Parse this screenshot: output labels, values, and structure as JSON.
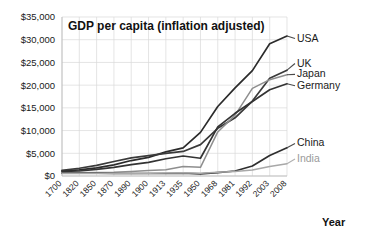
{
  "chart_data": {
    "type": "line",
    "title": "GDP per capita (inflation adjusted)",
    "xlabel": "Year",
    "ylabel": "",
    "ylim": [
      0,
      35000
    ],
    "grid": true,
    "legend_position": "inline-right",
    "categories": [
      "1700",
      "1820",
      "1850",
      "1870",
      "1890",
      "1900",
      "1913",
      "1935",
      "1950",
      "1968",
      "1981",
      "1992",
      "2003",
      "2008"
    ],
    "ytick_labels": [
      "$0",
      "$5,000",
      "$10,000",
      "$15,000",
      "$20,000",
      "$25,000",
      "$30,000",
      "$35,000"
    ],
    "ytick_values": [
      0,
      5000,
      10000,
      15000,
      20000,
      25000,
      30000,
      35000
    ],
    "series": [
      {
        "name": "USA",
        "color": "#2b2b2b",
        "values": [
          1100,
          1350,
          1800,
          2450,
          3400,
          4100,
          5300,
          6200,
          9600,
          15300,
          19400,
          23200,
          29100,
          30800
        ]
      },
      {
        "name": "UK",
        "color": "#3a3a3a",
        "values": [
          1250,
          1700,
          2350,
          3200,
          4000,
          4500,
          5000,
          5400,
          6900,
          10500,
          12800,
          16500,
          21500,
          23300
        ]
      },
      {
        "name": "Japan",
        "color": "#8e8e8e",
        "values": [
          800,
          700,
          750,
          800,
          1000,
          1200,
          1400,
          2100,
          1900,
          9700,
          13400,
          19300,
          21200,
          22300
        ]
      },
      {
        "name": "Germany",
        "color": "#333333",
        "values": [
          1000,
          1100,
          1450,
          1900,
          2500,
          3000,
          3800,
          4400,
          3900,
          10800,
          13800,
          16400,
          19000,
          20300
        ]
      },
      {
        "name": "China",
        "color": "#2e2e2e",
        "values": [
          600,
          600,
          600,
          550,
          550,
          550,
          550,
          600,
          450,
          750,
          1100,
          2200,
          4500,
          6200
        ]
      },
      {
        "name": "India",
        "color": "#a8a8a8",
        "values": [
          550,
          530,
          530,
          530,
          550,
          600,
          670,
          700,
          620,
          800,
          1000,
          1300,
          2100,
          2700
        ]
      }
    ],
    "series_labels": [
      {
        "name": "USA",
        "anchor_value": 30800,
        "label_y": 29600,
        "tone": "dark"
      },
      {
        "name": "UK",
        "anchor_value": 23300,
        "label_y": 24100,
        "tone": "dark"
      },
      {
        "name": "Japan",
        "anchor_value": 22300,
        "label_y": 21700,
        "tone": "dark"
      },
      {
        "name": "Germany",
        "anchor_value": 20300,
        "label_y": 19200,
        "tone": "dark"
      },
      {
        "name": "China",
        "anchor_value": 6200,
        "label_y": 6500,
        "tone": "dark"
      },
      {
        "name": "India",
        "anchor_value": 2700,
        "label_y": 3100,
        "tone": "light"
      }
    ]
  }
}
